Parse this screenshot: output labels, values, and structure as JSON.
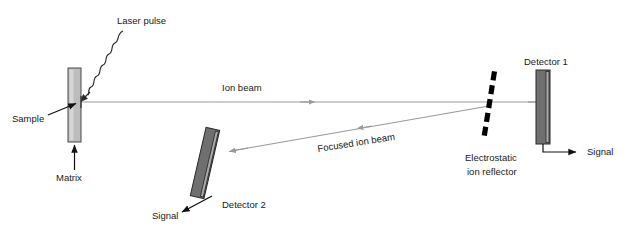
{
  "figure": {
    "background_color": "#ffffff",
    "width": 638,
    "height": 230
  },
  "palette": {
    "beam_gray": "#9a9a9a",
    "matrix_fill": "#bdbdbd",
    "detector_fill": "#6f6f6f",
    "detector_stripe": "#a9a9a9",
    "line_black": "#111111",
    "reflector_black": "#000000"
  },
  "labels": {
    "laser_pulse": "Laser pulse",
    "sample": "Sample",
    "matrix": "Matrix",
    "ion_beam": "Ion beam",
    "focused_ion_beam": "Focused ion beam",
    "electrostatic_reflector_line1": "Electrostatic",
    "electrostatic_reflector_line2": "ion reflector",
    "detector_1": "Detector 1",
    "detector_2": "Detector 2",
    "signal_1": "Signal",
    "signal_2": "Signal"
  },
  "components": [
    {
      "name": "matrix-sample-plate",
      "kind": "plate",
      "fill": "#bdbdbd",
      "x": 68,
      "y": 68,
      "width": 13,
      "height": 74,
      "rotation_deg": 0
    },
    {
      "name": "detector-1",
      "kind": "detector",
      "fill": "#6f6f6f",
      "x": 536,
      "y": 70,
      "width": 14,
      "height": 74,
      "rotation_deg": 0
    },
    {
      "name": "detector-2",
      "kind": "detector",
      "fill": "#6f6f6f",
      "x": 198,
      "y": 128,
      "width": 14,
      "height": 70,
      "rotation_deg": 13
    },
    {
      "name": "electrostatic-ion-reflector",
      "kind": "dashed-grid",
      "fill": "#000000",
      "x1": 494,
      "y1": 72,
      "x2": 483,
      "y2": 140,
      "dash_count": 6,
      "rotation_deg": 9
    }
  ],
  "beams": [
    {
      "name": "ion-beam",
      "label": "Ion beam",
      "from": [
        81,
        102
      ],
      "to": [
        542,
        102
      ],
      "color": "#9a9a9a",
      "arrow_at_mid": true,
      "label_angle_deg": 0
    },
    {
      "name": "focused-ion-beam",
      "label": "Focused ion beam",
      "from": [
        489,
        106
      ],
      "to": [
        228,
        152
      ],
      "color": "#9a9a9a",
      "arrow_at_end": true,
      "label_angle_deg": -9
    },
    {
      "name": "laser-pulse-beam",
      "label": "Laser pulse",
      "from": [
        123,
        30
      ],
      "to": [
        84,
        100
      ],
      "color": "#2b2b2b",
      "waveform": "sine",
      "arrow_at_end": true
    }
  ],
  "signal_leads": [
    {
      "name": "detector-1-signal-lead",
      "from_detector": "detector-1",
      "label": "Signal",
      "path": "M 543 144 L 543 152 L 578 152",
      "arrow_direction": "right"
    },
    {
      "name": "detector-2-signal-lead",
      "from_detector": "detector-2",
      "label": "Signal",
      "path": "M 213 196 L 180 213",
      "arrow_direction": "down-left"
    }
  ],
  "annotations": [
    {
      "name": "sample-annotation",
      "label": "Sample",
      "text_xy": [
        14,
        118
      ],
      "arrow_from": [
        46,
        116
      ],
      "arrow_to": [
        72,
        103
      ]
    },
    {
      "name": "matrix-annotation",
      "label": "Matrix",
      "text_xy": [
        56,
        177
      ],
      "arrow_from": [
        74,
        172
      ],
      "arrow_to": [
        74,
        146
      ]
    }
  ]
}
